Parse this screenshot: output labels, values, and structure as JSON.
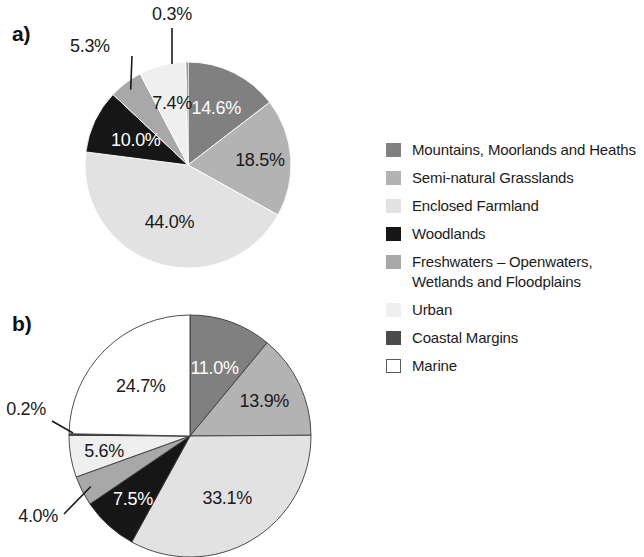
{
  "figure": {
    "panel_a_label": "a)",
    "panel_b_label": "b)"
  },
  "legend": {
    "items": [
      {
        "label": "Mountains, Moorlands and Heaths",
        "color": "#808080",
        "outlined": false
      },
      {
        "label": "Semi-natural Grasslands",
        "color": "#b3b3b3",
        "outlined": false
      },
      {
        "label": "Enclosed Farmland",
        "color": "#e2e2e2",
        "outlined": false
      },
      {
        "label": "Woodlands",
        "color": "#161616",
        "outlined": false
      },
      {
        "label": "Freshwaters – Openwaters, Wetlands and Floodplains",
        "color": "#a8a8a8",
        "outlined": false
      },
      {
        "label": "Urban",
        "color": "#efefef",
        "outlined": false
      },
      {
        "label": "Coastal Margins",
        "color": "#4b4b4b",
        "outlined": false
      },
      {
        "label": "Marine",
        "color": "#ffffff",
        "outlined": true
      }
    ]
  },
  "chart_data": [
    {
      "type": "pie",
      "id": "a",
      "title": "a)",
      "start_angle_deg": 0,
      "direction": "clockwise",
      "categories": [
        "Mountains, Moorlands and Heaths",
        "Semi-natural Grasslands",
        "Enclosed Farmland",
        "Woodlands",
        "Freshwaters – Openwaters, Wetlands and Floodplains",
        "Urban",
        "Coastal Margins"
      ],
      "values": [
        14.6,
        18.5,
        44.0,
        10.0,
        5.3,
        7.4,
        0.3
      ],
      "labels": [
        "14.6%",
        "18.5%",
        "44.0%",
        "10.0%",
        "5.3%",
        "7.4%",
        "0.3%"
      ],
      "colors": [
        "#808080",
        "#b3b3b3",
        "#e2e2e2",
        "#161616",
        "#a8a8a8",
        "#efefef",
        "#4b4b4b"
      ],
      "label_placement": [
        "inside",
        "inside",
        "inside",
        "inside",
        "outside",
        "inside",
        "outside"
      ],
      "units": "percent"
    },
    {
      "type": "pie",
      "id": "b",
      "title": "b)",
      "start_angle_deg": 0,
      "direction": "clockwise",
      "categories": [
        "Mountains, Moorlands and Heaths",
        "Semi-natural Grasslands",
        "Enclosed Farmland",
        "Woodlands",
        "Freshwaters – Openwaters, Wetlands and Floodplains",
        "Urban",
        "Coastal Margins",
        "Marine"
      ],
      "values": [
        11.0,
        13.9,
        33.1,
        7.5,
        4.0,
        5.6,
        0.2,
        24.7
      ],
      "labels": [
        "11.0%",
        "13.9%",
        "33.1%",
        "7.5%",
        "4.0%",
        "5.6%",
        "0.2%",
        "24.7%"
      ],
      "colors": [
        "#808080",
        "#b3b3b3",
        "#e2e2e2",
        "#161616",
        "#a8a8a8",
        "#efefef",
        "#4b4b4b",
        "#ffffff"
      ],
      "label_placement": [
        "inside",
        "inside",
        "inside",
        "inside",
        "outside",
        "inside",
        "outside",
        "inside"
      ],
      "units": "percent"
    }
  ]
}
